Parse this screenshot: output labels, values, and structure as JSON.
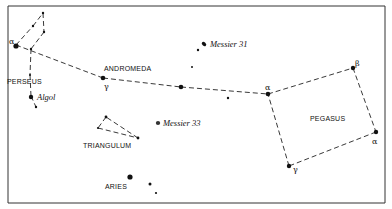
{
  "chart": {
    "constellations": [
      {
        "name": "PERSEUS",
        "label_pos": [
          7,
          82
        ]
      },
      {
        "name": "ANDROMEDA",
        "label_pos": [
          104,
          69
        ]
      },
      {
        "name": "TRIANGULUM",
        "label_pos": [
          83,
          146
        ]
      },
      {
        "name": "ARIES",
        "label_pos": [
          106,
          189
        ]
      },
      {
        "name": "PEGASUS",
        "label_pos": [
          310,
          121
        ]
      }
    ],
    "objects": [
      {
        "name": "Algol",
        "label": "Algol"
      },
      {
        "name": "Messier 31",
        "label": "Messier 31"
      },
      {
        "name": "Messier 33",
        "label": "Messier 33"
      }
    ],
    "greek_labels": {
      "perseus_alpha": "α",
      "andromeda_gamma": "γ",
      "andromeda_alpha": "α",
      "pegasus_beta": "β",
      "pegasus_alpha": "α",
      "pegasus_gamma": "γ"
    },
    "labels": {
      "perseus": "PERSEUS",
      "andromeda": "ANDROMEDA",
      "triangulum": "TRIANGULUM",
      "aries": "ARIES",
      "pegasus": "PEGASUS",
      "algol": "Algol",
      "m31": "Messier 31",
      "m33": "Messier 33"
    }
  }
}
